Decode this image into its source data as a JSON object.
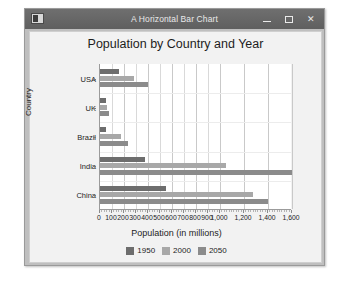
{
  "window": {
    "title": "A Horizontal Bar Chart",
    "icon": "app-icon",
    "buttons": {
      "minimize": "–",
      "maximize": "□",
      "close": "✕"
    }
  },
  "chart_data": {
    "type": "bar",
    "orientation": "horizontal",
    "title": "Population by Country and Year",
    "xlabel": "Population (in millions)",
    "ylabel": "Country",
    "categories": [
      "USA",
      "UK",
      "Brazil",
      "India",
      "China"
    ],
    "series": [
      {
        "name": "1950",
        "color": "#6d6d6d",
        "values": [
          157,
          50,
          53,
          376,
          554
        ]
      },
      {
        "name": "2000",
        "color": "#a8a8a8",
        "values": [
          282,
          59,
          175,
          1053,
          1275
        ]
      },
      {
        "name": "2050",
        "color": "#8b8b8b",
        "values": [
          400,
          75,
          233,
          1650,
          1400
        ]
      }
    ],
    "xlim": [
      0,
      1600
    ],
    "xticks": [
      0,
      100,
      200,
      300,
      400,
      500,
      600,
      700,
      800,
      900,
      1000,
      1200,
      1400,
      1600
    ],
    "xticklabels": [
      "0",
      "100",
      "200",
      "300",
      "400",
      "500",
      "600",
      "700",
      "800",
      "900",
      "1,000",
      "1,200",
      "1,400",
      "1,600"
    ],
    "grid": true,
    "legend_position": "bottom",
    "legend": [
      "1950",
      "2000",
      "2050"
    ]
  }
}
